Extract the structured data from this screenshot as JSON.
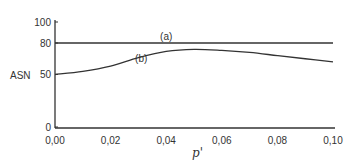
{
  "chart_data": {
    "type": "line",
    "title": "",
    "xlabel": "p'",
    "ylabel": "ASN",
    "xlim": [
      0.0,
      0.1
    ],
    "ylim": [
      0,
      100
    ],
    "x_ticks": [
      "0,00",
      "0,02",
      "0,04",
      "0,06",
      "0,08",
      "0,10"
    ],
    "x_tick_values": [
      0.0,
      0.02,
      0.04,
      0.06,
      0.08,
      0.1
    ],
    "y_ticks": [
      "0",
      "50",
      "80",
      "100"
    ],
    "y_tick_values": [
      0,
      50,
      80,
      100
    ],
    "grid": false,
    "legend": "inline labels",
    "series": [
      {
        "name": "(a)",
        "x": [
          0.0,
          0.02,
          0.04,
          0.06,
          0.08,
          0.1
        ],
        "values": [
          80,
          80,
          80,
          80,
          80,
          80
        ]
      },
      {
        "name": "(b)",
        "x": [
          0.0,
          0.01,
          0.02,
          0.03,
          0.04,
          0.05,
          0.06,
          0.07,
          0.08,
          0.09,
          0.1
        ],
        "values": [
          50,
          53,
          58,
          66,
          72,
          74,
          73,
          71,
          68,
          65,
          62
        ]
      }
    ],
    "annotations": [
      {
        "text": "(a)",
        "x": 0.04,
        "y": 83
      },
      {
        "text": "(b)",
        "x": 0.031,
        "y": 62
      }
    ]
  }
}
